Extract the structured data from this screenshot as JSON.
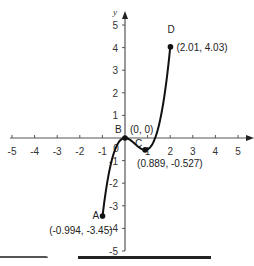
{
  "chart_data": {
    "type": "line",
    "title": "",
    "xlabel": "",
    "ylabel": "y",
    "xlim": [
      -5,
      5
    ],
    "ylim": [
      -5,
      5
    ],
    "grid": false,
    "x_ticks": [
      -5,
      -4,
      -3,
      -2,
      -1,
      1,
      2,
      3,
      4,
      5
    ],
    "y_ticks": [
      -5,
      -4,
      -3,
      -2,
      -1,
      1,
      2,
      3,
      4,
      5
    ],
    "origin_label": "0",
    "function_fit": "y = 1.5x^3 - 2x^2",
    "domain": [
      -0.994,
      2.01
    ],
    "points": [
      {
        "name": "A",
        "x": -0.994,
        "y": -3.45,
        "label": "(-0.994, -3.45)"
      },
      {
        "name": "B",
        "x": 0,
        "y": 0,
        "label": "(0, 0)"
      },
      {
        "name": "C",
        "x": 0.889,
        "y": -0.527,
        "label": "(0.889, -0.527)"
      },
      {
        "name": "D",
        "x": 2.01,
        "y": 4.03,
        "label": "(2.01, 4.03)"
      }
    ],
    "curve_color": "#111111",
    "axis_color": "#555555"
  }
}
